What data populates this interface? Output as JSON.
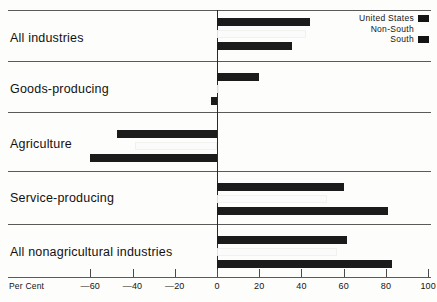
{
  "chart_data": {
    "type": "bar",
    "orientation": "horizontal",
    "title": "",
    "xlabel": "Per Cent",
    "ylabel": "",
    "xlim": [
      -70,
      105
    ],
    "grid": false,
    "legend_position": "top-right",
    "categories": [
      "All industries",
      "Goods-producing",
      "Agriculture",
      "Service-producing",
      "All nonagricultural industries"
    ],
    "series": [
      {
        "name": "United States",
        "color": "#1b1b1b",
        "values": [
          44,
          20,
          -47.5,
          60,
          61.5
        ]
      },
      {
        "name": "Non-South",
        "color": "#fbfbfb",
        "values": [
          42,
          1,
          -39,
          52,
          57
        ]
      },
      {
        "name": "South",
        "color": "#1b1b1b",
        "values": [
          35.5,
          -3,
          -60,
          81,
          83
        ]
      }
    ],
    "ticks": [
      -60,
      -40,
      -20,
      0,
      20,
      40,
      60,
      80,
      100
    ],
    "tick_labels": [
      "—60",
      "—40",
      "—20",
      "0",
      "20",
      "40",
      "60",
      "80",
      "100"
    ]
  },
  "legend": {
    "items": [
      {
        "label": "United States",
        "swatch": "dark"
      },
      {
        "label": "Non-South",
        "swatch": "light"
      },
      {
        "label": "South",
        "swatch": "dark"
      }
    ]
  },
  "axis": {
    "title": "Per Cent"
  }
}
